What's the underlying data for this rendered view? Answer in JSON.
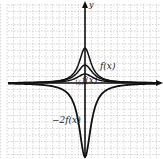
{
  "chart_data": {
    "type": "line",
    "title": "",
    "xlabel": "",
    "ylabel": "y",
    "grid": true,
    "xlim": [
      -12,
      12
    ],
    "ylim": [
      -12,
      12
    ],
    "series": [
      {
        "name": "f(x)",
        "label": "f(x)",
        "peak": 3,
        "description": "bell-shaped curve, peak 3 at x=0"
      },
      {
        "name": "1/2 f(x)",
        "label": "½ f(x)",
        "peak": 1.5,
        "description": "half of f(x), flatter"
      },
      {
        "name": "2 f(x)",
        "label": "",
        "peak": 6,
        "description": "tallest positive curve"
      },
      {
        "name": "-2 f(x)",
        "label": "−2f(x)",
        "peak": -12,
        "description": "reflected and stretched, dips to bottom"
      }
    ],
    "annotations": [
      "f(x)",
      "½ f(x)",
      "−2f(x)",
      "y"
    ]
  },
  "labels": {
    "y_axis": "y",
    "f": "f(x)",
    "half_f": "f(x)",
    "half_frac": "½",
    "neg2f": "−2f(x)"
  }
}
